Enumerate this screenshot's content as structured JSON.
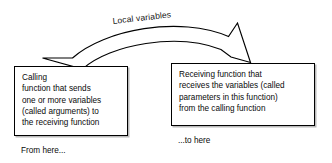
{
  "diagram": {
    "arrow": {
      "label": "Local variables",
      "direction": "left-to-right curved",
      "icon": "curved-block-arrow-icon",
      "stroke_color": "#000000",
      "fill_color": "#ffffff"
    },
    "boxes": [
      {
        "id": "calling-function",
        "text": "Calling\nfunction that sends\none or more variables\n(called arguments) to\nthe receiving function",
        "caption": "From here..."
      },
      {
        "id": "receiving-function",
        "text": "Receiving function that\nreceives the variables (called\nparameters in this function)\nfrom the calling function",
        "caption": "...to here"
      }
    ]
  }
}
